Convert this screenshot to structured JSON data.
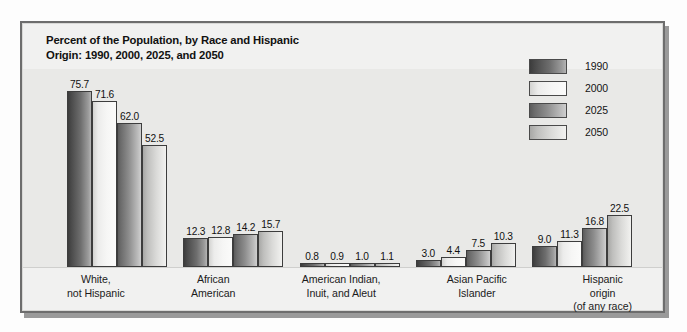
{
  "figure": {
    "title_lines": [
      "Percent of the Population, by Race and Hispanic",
      "Origin: 1990, 2000, 2025, and 2050"
    ],
    "frame_color": "#6d6d6d",
    "plot_band_color": "#e9e9e7",
    "page_background": "#fdfdfd"
  },
  "legend": {
    "position": "top-right",
    "entries": [
      {
        "label": "1990",
        "swatch": "dark-gradient-swatch"
      },
      {
        "label": "2000",
        "swatch": "light-gradient-swatch"
      },
      {
        "label": "2025",
        "swatch": "medium-dark-gradient-swatch"
      },
      {
        "label": "2050",
        "swatch": "medium-light-gradient-swatch"
      }
    ]
  },
  "chart_data": {
    "type": "bar",
    "title": "Percent of the Population, by Race and Hispanic Origin: 1990, 2000, 2025, and 2050",
    "xlabel": "",
    "ylabel": "",
    "ylim": [
      0,
      80
    ],
    "grid": false,
    "legend_position": "top-right",
    "categories": [
      "White, not Hispanic",
      "African American",
      "American Indian, Inuit, and Aleut",
      "Asian Pacific Islander",
      "Hispanic origin (of any race)"
    ],
    "category_label_lines": [
      [
        "White,",
        "not Hispanic"
      ],
      [
        "African",
        "American"
      ],
      [
        "American Indian,",
        "Inuit, and Aleut"
      ],
      [
        "Asian Pacific",
        "Islander"
      ],
      [
        "Hispanic",
        "origin",
        "(of any race)"
      ]
    ],
    "series": [
      {
        "name": "1990",
        "values": [
          75.7,
          12.3,
          0.8,
          3.0,
          9.0
        ]
      },
      {
        "name": "2000",
        "values": [
          71.6,
          12.8,
          0.9,
          4.4,
          11.3
        ]
      },
      {
        "name": "2025",
        "values": [
          62.0,
          14.2,
          1.0,
          7.5,
          16.8
        ]
      },
      {
        "name": "2050",
        "values": [
          52.5,
          15.7,
          1.1,
          10.3,
          22.5
        ]
      }
    ],
    "value_labels": [
      [
        "75.7",
        "71.6",
        "62.0",
        "52.5"
      ],
      [
        "12.3",
        "12.8",
        "14.2",
        "15.7"
      ],
      [
        "0.8",
        "0.9",
        "1.0",
        "1.1"
      ],
      [
        "3.0",
        "4.4",
        "7.5",
        "10.3"
      ],
      [
        "9.0",
        "11.3",
        "16.8",
        "22.5"
      ]
    ]
  }
}
